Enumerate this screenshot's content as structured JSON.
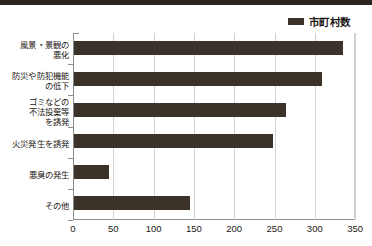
{
  "legend": {
    "swatch_color": "#3a3128",
    "label": "市町村数"
  },
  "axis": {
    "x_ticks": [
      "0",
      "50",
      "100",
      "150",
      "200",
      "250",
      "300",
      "350"
    ]
  },
  "categories": [
    "風景・景観の\n悪化",
    "防災や防犯機能\nの低下",
    "ゴミなどの\n不法投棄等\nを誘発",
    "火災発生を誘発",
    "悪臭の発生",
    "その他"
  ],
  "chart_data": {
    "type": "bar",
    "orientation": "horizontal",
    "title": "",
    "subtitle": "",
    "xlabel": "",
    "ylabel": "",
    "xlim": [
      0,
      350
    ],
    "xtick_step": 50,
    "grid": true,
    "legend_position": "top-right",
    "series": [
      {
        "name": "市町村数",
        "color": "#3b3229",
        "values": [
          334,
          308,
          263,
          247,
          43,
          144
        ]
      }
    ],
    "categories": [
      "風景・景観の悪化",
      "防災や防犯機能の低下",
      "ゴミなどの不法投棄等を誘発",
      "火災発生を誘発",
      "悪臭の発生",
      "その他"
    ],
    "bars": [
      {
        "category": "風景・景観の悪化",
        "value": 334
      },
      {
        "category": "防災や防犯機能の低下",
        "value": 308
      },
      {
        "category": "ゴミなどの不法投棄等を誘発",
        "value": 263
      },
      {
        "category": "火災発生を誘発",
        "value": 247
      },
      {
        "category": "悪臭の発生",
        "value": 43
      },
      {
        "category": "その他",
        "value": 144
      }
    ]
  }
}
